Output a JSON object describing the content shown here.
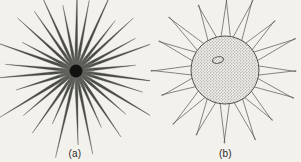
{
  "figure": {
    "background_color": "#f3f1ec",
    "ink_color": "#3a3a38",
    "width": 301,
    "height": 162,
    "panels": [
      {
        "id": "a",
        "caption": "(a)",
        "subject": "radiating-star-organism",
        "center": {
          "x": 76,
          "y": 71
        },
        "core": {
          "name": "dark-central-core",
          "radius": 6.5,
          "color": "#121210"
        },
        "halo": {
          "name": "dense-inner-halo",
          "radius": 18,
          "color": "#6e6e6a"
        },
        "rays": {
          "count": 30,
          "min_length": 58,
          "max_length": 92,
          "base_width": 2.0,
          "tip_width": 0.35,
          "color": "#4a4a46",
          "lengths": [
            86,
            72,
            90,
            64,
            78,
            68,
            88,
            60,
            82,
            70,
            92,
            66,
            80,
            62,
            85,
            74,
            89,
            58,
            76,
            69,
            91,
            63,
            83,
            71,
            87,
            61,
            79,
            73,
            84,
            67
          ],
          "angle_jitter": [
            0.8,
            -1.4,
            0.3,
            1.9,
            -0.7,
            1.2,
            -1.8,
            0.5,
            1.5,
            -0.4,
            0.9,
            -1.1,
            1.7,
            -0.2,
            0.6,
            -1.6,
            1.3,
            0.1,
            -0.9,
            1.8,
            -1.3,
            0.4,
            1.0,
            -0.6,
            1.6,
            -1.9,
            0.2,
            1.1,
            -0.5,
            0.7
          ]
        }
      },
      {
        "id": "b",
        "caption": "(b)",
        "subject": "stippled-body-organism",
        "center": {
          "x": 75,
          "y": 70
        },
        "body": {
          "name": "stippled-cell-body",
          "radius": 34,
          "fill_color": "#c8c6c2",
          "outline_color": "#55534f",
          "texture": "stipple"
        },
        "nucleus": {
          "name": "nucleus-ellipse",
          "cx": 68,
          "cy": 60,
          "rx": 5.5,
          "ry": 3.2,
          "outline_color": "#4a4845"
        },
        "spines": {
          "count": 16,
          "base_half_angle_deg": 8.5,
          "length": 40,
          "tip_width": 0.8,
          "outline_color": "#55534f",
          "lengths": [
            38,
            41,
            36,
            43,
            37,
            40,
            35,
            42,
            39,
            37,
            41,
            34,
            40,
            38,
            43,
            36
          ],
          "angle_jitter": [
            1.2,
            -0.8,
            0.5,
            -1.5,
            0.9,
            -0.3,
            1.7,
            -1.0,
            0.4,
            1.3,
            -1.2,
            0.7,
            -0.6,
            1.1,
            -1.7,
            0.2
          ]
        }
      }
    ]
  }
}
